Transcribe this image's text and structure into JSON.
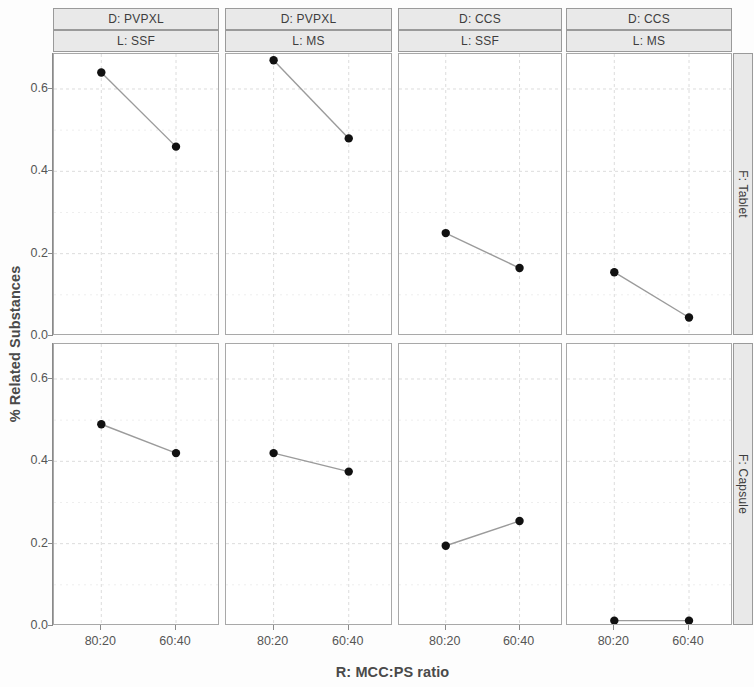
{
  "chart_data": {
    "type": "line",
    "title": "",
    "xlabel": "R: MCC:PS ratio",
    "ylabel": "% Related Substances",
    "categories": [
      "80:20",
      "60:40"
    ],
    "x_tick_labels": [
      "80:20",
      "60:40"
    ],
    "y_tick_labels": [
      "0.0",
      "0.2",
      "0.4",
      "0.6"
    ],
    "y_ticks": [
      0.0,
      0.2,
      0.4,
      0.6
    ],
    "ylim": [
      0.0,
      0.685
    ],
    "grid": true,
    "legend": "none",
    "marker": "filled-circle",
    "marker_color": "#111111",
    "line_color": "#9b9b9b",
    "row_variable": "F",
    "col_variables": [
      "D",
      "L"
    ],
    "row_levels": [
      "F: Tablet",
      "F: Capsule"
    ],
    "col_levels": [
      {
        "d": "D: PVPXL",
        "l": "L: SSF"
      },
      {
        "d": "D: PVPXL",
        "l": "L: MS"
      },
      {
        "d": "D: CCS",
        "l": "L: SSF"
      },
      {
        "d": "D: CCS",
        "l": "L: MS"
      }
    ],
    "panels": [
      {
        "row": "F: Tablet",
        "d": "D: PVPXL",
        "l": "L: SSF",
        "values": [
          0.64,
          0.46
        ]
      },
      {
        "row": "F: Tablet",
        "d": "D: PVPXL",
        "l": "L: MS",
        "values": [
          0.67,
          0.48
        ]
      },
      {
        "row": "F: Tablet",
        "d": "D: CCS",
        "l": "L: SSF",
        "values": [
          0.25,
          0.165
        ]
      },
      {
        "row": "F: Tablet",
        "d": "D: CCS",
        "l": "L: MS",
        "values": [
          0.155,
          0.045
        ]
      },
      {
        "row": "F: Capsule",
        "d": "D: PVPXL",
        "l": "L: SSF",
        "values": [
          0.49,
          0.42
        ]
      },
      {
        "row": "F: Capsule",
        "d": "D: PVPXL",
        "l": "L: MS",
        "values": [
          0.42,
          0.375
        ]
      },
      {
        "row": "F: Capsule",
        "d": "D: CCS",
        "l": "L: SSF",
        "values": [
          0.195,
          0.255
        ]
      },
      {
        "row": "F: Capsule",
        "d": "D: CCS",
        "l": "L: MS",
        "values": [
          0.013,
          0.013
        ]
      }
    ]
  },
  "axes": {
    "y_title": "% Related Substances",
    "x_title": "R: MCC:PS ratio"
  },
  "strips": {
    "col_d": [
      "D: PVPXL",
      "D: PVPXL",
      "D: CCS",
      "D: CCS"
    ],
    "col_l": [
      "L: SSF",
      "L: MS",
      "L: SSF",
      "L: MS"
    ],
    "rows": [
      "F: Tablet",
      "F: Capsule"
    ]
  },
  "ticks": {
    "y": [
      "0.0",
      "0.2",
      "0.4",
      "0.6"
    ],
    "x": [
      "80:20",
      "60:40"
    ]
  },
  "colors": {
    "marker": "#111111",
    "line": "#9b9b9b",
    "grid": "#dcdcdc",
    "strip_bg": "#e9e9e9",
    "strip_border": "#9a9a9a",
    "panel_border": "#a8a8a8",
    "text": "#3d3d3d"
  }
}
